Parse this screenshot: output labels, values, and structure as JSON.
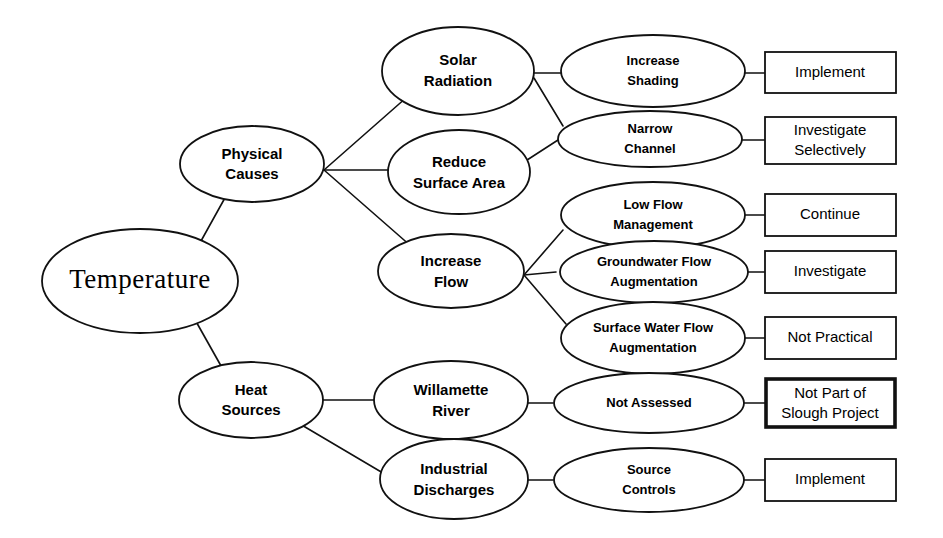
{
  "diagram": {
    "title": "Temperature",
    "type": "cause-and-effect tree",
    "nodes": {
      "root": {
        "label": "Temperature",
        "shape": "ellipse"
      },
      "physical_causes": {
        "label_line1": "Physical",
        "label_line2": "Causes",
        "shape": "ellipse"
      },
      "heat_sources": {
        "label_line1": "Heat",
        "label_line2": "Sources",
        "shape": "ellipse"
      },
      "solar_radiation": {
        "label_line1": "Solar",
        "label_line2": "Radiation",
        "shape": "ellipse"
      },
      "reduce_surface_area": {
        "label_line1": "Reduce",
        "label_line2": "Surface Area",
        "shape": "ellipse"
      },
      "increase_flow": {
        "label_line1": "Increase",
        "label_line2": "Flow",
        "shape": "ellipse"
      },
      "willamette_river": {
        "label_line1": "Willamette",
        "label_line2": "River",
        "shape": "ellipse"
      },
      "industrial_discharges": {
        "label_line1": "Industrial",
        "label_line2": "Discharges",
        "shape": "ellipse"
      },
      "increase_shading": {
        "label_line1": "Increase",
        "label_line2": "Shading",
        "shape": "ellipse"
      },
      "narrow_channel": {
        "label_line1": "Narrow",
        "label_line2": "Channel",
        "shape": "ellipse"
      },
      "low_flow_management": {
        "label_line1": "Low Flow",
        "label_line2": "Management",
        "shape": "ellipse"
      },
      "groundwater_flow_augmentation": {
        "label_line1": "Groundwater Flow",
        "label_line2": "Augmentation",
        "shape": "ellipse"
      },
      "surface_water_flow_augmentation": {
        "label_line1": "Surface Water Flow",
        "label_line2": "Augmentation",
        "shape": "ellipse"
      },
      "not_assessed": {
        "label_line1": "Not Assessed",
        "label_line2": "",
        "shape": "ellipse"
      },
      "source_controls": {
        "label_line1": "Source",
        "label_line2": "Controls",
        "shape": "ellipse"
      },
      "action_implement_shading": {
        "label_line1": "Implement",
        "label_line2": "",
        "shape": "rectangle"
      },
      "action_investigate_selectively": {
        "label_line1": "Investigate",
        "label_line2": "Selectively",
        "shape": "rectangle"
      },
      "action_continue": {
        "label_line1": "Continue",
        "label_line2": "",
        "shape": "rectangle"
      },
      "action_investigate": {
        "label_line1": "Investigate",
        "label_line2": "",
        "shape": "rectangle"
      },
      "action_not_practical": {
        "label_line1": "Not Practical",
        "label_line2": "",
        "shape": "rectangle"
      },
      "action_not_part_of_slough_project": {
        "label_line1": "Not Part of",
        "label_line2": "Slough Project",
        "shape": "rectangle",
        "emphasis": true
      },
      "action_implement_source_controls": {
        "label_line1": "Implement",
        "label_line2": "",
        "shape": "rectangle"
      }
    },
    "colors": {
      "stroke": "#111111",
      "fill": "#ffffff",
      "text": "#000000",
      "background": "#ffffff"
    }
  }
}
